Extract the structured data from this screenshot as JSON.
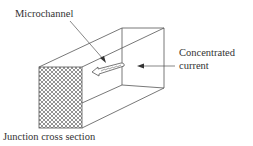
{
  "diagram": {
    "labels": {
      "microchannel": "Microchannel",
      "concentrated_current_line1": "Concentrated",
      "concentrated_current_line2": "current",
      "junction_cross_section": "Junction cross section"
    },
    "colors": {
      "line": "#555555",
      "hatch": "#666666",
      "background": "#ffffff"
    }
  }
}
